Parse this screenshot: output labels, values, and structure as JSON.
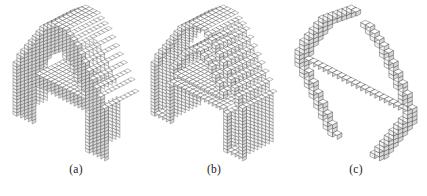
{
  "figure": {
    "background_color": "#ffffff",
    "ink_color": "#000000",
    "letter": "A",
    "rendering": "isometric voxel cubes",
    "panels": [
      {
        "id": "a",
        "caption": "(a)",
        "mode": "solid",
        "description": "Solid voxelized letter A",
        "cube_size": 3.2,
        "origin_x": 16,
        "origin_y": 20,
        "depth": 9,
        "stroke_color": "#3a3a3a",
        "top_color": "#ffffff",
        "left_color": "#f2f2f2",
        "right_color": "#d8d8d8"
      },
      {
        "id": "b",
        "caption": "(b)",
        "mode": "shell",
        "description": "Hollow surface shell of voxelized letter A",
        "cube_size": 3.2,
        "origin_x": 14,
        "origin_y": 20,
        "depth": 9,
        "stroke_color": "#3a3a3a",
        "top_color": "#ffffff",
        "left_color": "#f2f2f2",
        "right_color": "#d8d8d8"
      },
      {
        "id": "c",
        "caption": "(c)",
        "mode": "skeleton",
        "description": "Curve skeleton of voxelized letter A",
        "cube_size": 3.4,
        "origin_x": 22,
        "origin_y": 20,
        "depth": 1,
        "stroke_color": "#3a3a3a",
        "top_color": "#ffffff",
        "left_color": "#f2f2f2",
        "right_color": "#d8d8d8"
      }
    ],
    "letter_mask": {
      "width": 26,
      "height": 34,
      "note": "1 = filled voxel column, 0 = empty; row 0 is top of the letter",
      "rows": [
        "00000000001111000000000000",
        "00000000011111100000000000",
        "00000000111111110000000000",
        "00000001111111111000000000",
        "00000001111111111000000000",
        "00000011111111111100000000",
        "00000011111111111100000000",
        "00000111111111111110000000",
        "00000111111001111110000000",
        "00001111110000111111000000",
        "00001111100000011111000000",
        "00011111100000011111100000",
        "00011111000000001111100000",
        "00111111000000001111110000",
        "00111110000000000111110000",
        "01111110000000000111111000",
        "01111100000000000011111000",
        "01111100000000000011111000",
        "11111111111111111111111100",
        "11111111111111111111111100",
        "11111111111111111111111100",
        "11111111111111111111111100",
        "11111000000000000001111100",
        "11111000000000000001111100",
        "11111000000000000001111100",
        "11111000000000000001111100",
        "11111000000000000001111100",
        "11111000000000000001111100",
        "11111000000000000001111100",
        "11111000000000000001111100",
        "11111000000000000001111100",
        "11111000000000000001111100",
        "11111000000000000001111100",
        "11111000000000000001111100"
      ]
    },
    "skeleton_mask": {
      "width": 26,
      "height": 34,
      "note": "1 = skeleton voxel (medial axis chain)",
      "rows": [
        "00000000000110000000000000",
        "00000000001100000000000000",
        "00000000011000110000000000",
        "00000000110000011000000000",
        "00000001100000001100000000",
        "00000011000000000110000000",
        "00000110000000000011000000",
        "00000110000000000011000000",
        "00001100000000000001100000",
        "00001100000000000001100000",
        "00011000000000000000110000",
        "00011000000000000000110000",
        "00110000000000000000011000",
        "00110000000000000000011000",
        "01100000000000000000001100",
        "01100000000000000000001100",
        "01100000000000000000001100",
        "11000000000000000000000110",
        "11111111111111111111111110",
        "11000000000000000000000110",
        "11000000000000000000000110",
        "01100000000000000000001100",
        "01100000000000000000001100",
        "00110000000000000000011000",
        "00110000000000000000011000",
        "00011000000000000000110000",
        "00011000000000000000110000",
        "00001100000000000001100000",
        "00001100000000000001100000",
        "00000110000000000011000000",
        "00000110000000000011000000",
        "00000011000000000110000000",
        "00000011000000000110000000",
        "00000001100000001100000000"
      ]
    }
  }
}
